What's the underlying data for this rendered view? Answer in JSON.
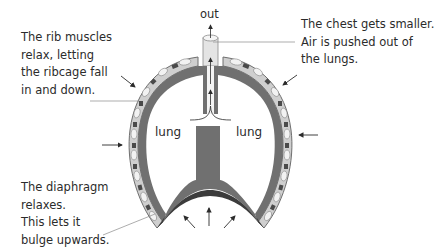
{
  "diagram": {
    "labels": {
      "out": "out",
      "lung_left": "lung",
      "lung_right": "lung"
    },
    "annotations": {
      "rib_muscles": [
        "The rib muscles",
        "relax, letting",
        "the ribcage fall",
        "in and down."
      ],
      "chest": [
        "The chest gets smaller.",
        "Air is pushed out of",
        "the lungs."
      ],
      "diaphragm": [
        "The diaphragm",
        "relaxes.",
        "This lets it",
        "bulge upwards."
      ]
    },
    "colors": {
      "muscle": "#6e6e6e",
      "rib_outer": "#c8c8c8",
      "rib_bone": "#f2f2f2",
      "rib_dark": "#4a4a4a",
      "diaphragm_dark": "#3c3c3c",
      "trachea": "#e4e4e4",
      "text": "#2b2b2b"
    }
  }
}
